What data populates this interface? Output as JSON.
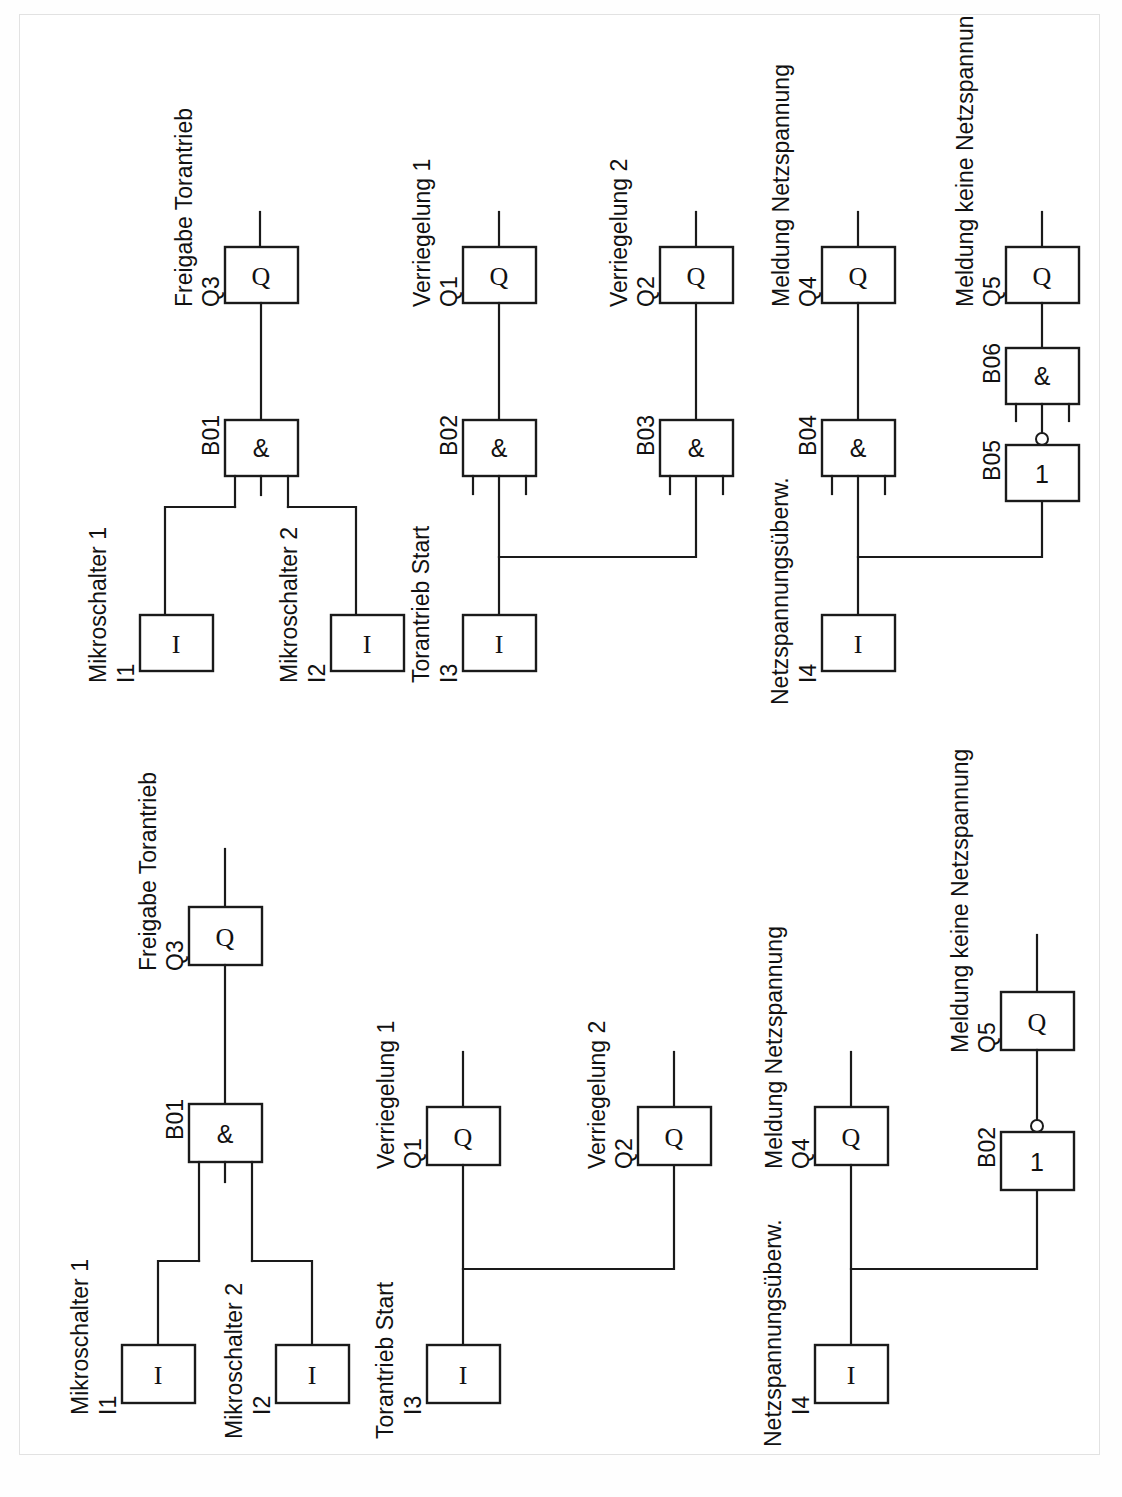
{
  "document": {
    "kind": "logic-function-block-diagram",
    "language": "de",
    "page_border_color": "#e2e2e2",
    "line_color": "#1a1a1a",
    "background": "#ffffff",
    "orientation_note": "diagram drawn rotated 90 degrees counter-clockwise on the sheet",
    "diagram_count": 2
  },
  "symbols": {
    "input_block": "I",
    "output_block": "Q",
    "and_gate": "&",
    "or_gate": "1",
    "inverter_bubble": "o"
  },
  "diagrams": [
    {
      "id": "diagram-upper",
      "name": "Schaltung mit Verriegelungs-Gattern",
      "blocks": [
        {
          "id": "I1",
          "type": "input",
          "symbol": "I",
          "tag": "I1",
          "label": "Mikroschalter 1"
        },
        {
          "id": "I2",
          "type": "input",
          "symbol": "I",
          "tag": "I2",
          "label": "Mikroschalter 2"
        },
        {
          "id": "I3",
          "type": "input",
          "symbol": "I",
          "tag": "I3",
          "label": "Torantrieb Start"
        },
        {
          "id": "I4",
          "type": "input",
          "symbol": "I",
          "tag": "I4",
          "label": "Netzspannungsüberw."
        },
        {
          "id": "B01",
          "type": "and",
          "symbol": "&",
          "tag": "B01",
          "label": "",
          "inputs": 3,
          "inverted_output": false
        },
        {
          "id": "B02",
          "type": "and",
          "symbol": "&",
          "tag": "B02",
          "label": "",
          "inputs": 3,
          "inverted_output": false
        },
        {
          "id": "B03",
          "type": "and",
          "symbol": "&",
          "tag": "B03",
          "label": "",
          "inputs": 3,
          "inverted_output": false
        },
        {
          "id": "B04",
          "type": "and",
          "symbol": "&",
          "tag": "B04",
          "label": "",
          "inputs": 3,
          "inverted_output": false
        },
        {
          "id": "B05",
          "type": "or",
          "symbol": "1",
          "tag": "B05",
          "label": "",
          "inputs": 1,
          "inverted_output": true
        },
        {
          "id": "B06",
          "type": "and",
          "symbol": "&",
          "tag": "B06",
          "label": "",
          "inputs": 3,
          "inverted_output": false
        },
        {
          "id": "Q3",
          "type": "output",
          "symbol": "Q",
          "tag": "Q3",
          "label": "Freigabe Torantrieb"
        },
        {
          "id": "Q1",
          "type": "output",
          "symbol": "Q",
          "tag": "Q1",
          "label": "Verriegelung 1"
        },
        {
          "id": "Q2",
          "type": "output",
          "symbol": "Q",
          "tag": "Q2",
          "label": "Verriegelung 2"
        },
        {
          "id": "Q4",
          "type": "output",
          "symbol": "Q",
          "tag": "Q4",
          "label": "Meldung Netzspannung"
        },
        {
          "id": "Q5",
          "type": "output",
          "symbol": "Q",
          "tag": "Q5",
          "label": "Meldung keine Netzspannung"
        }
      ],
      "connections": [
        {
          "from": "I1",
          "to": "B01"
        },
        {
          "from": "I2",
          "to": "B01"
        },
        {
          "from": "B01",
          "to": "Q3"
        },
        {
          "from": "I3",
          "to": "B02"
        },
        {
          "from": "I3",
          "to": "B03"
        },
        {
          "from": "B02",
          "to": "Q1"
        },
        {
          "from": "B03",
          "to": "Q2"
        },
        {
          "from": "I4",
          "to": "B04"
        },
        {
          "from": "I4",
          "to": "B05"
        },
        {
          "from": "B04",
          "to": "Q4"
        },
        {
          "from": "B05",
          "to": "B06"
        },
        {
          "from": "B06",
          "to": "Q5"
        }
      ]
    },
    {
      "id": "diagram-lower",
      "name": "Vereinfachte Schaltung",
      "blocks": [
        {
          "id": "I1",
          "type": "input",
          "symbol": "I",
          "tag": "I1",
          "label": "Mikroschalter 1"
        },
        {
          "id": "I2",
          "type": "input",
          "symbol": "I",
          "tag": "I2",
          "label": "Mikroschalter 2"
        },
        {
          "id": "I3",
          "type": "input",
          "symbol": "I",
          "tag": "I3",
          "label": "Torantrieb Start"
        },
        {
          "id": "I4",
          "type": "input",
          "symbol": "I",
          "tag": "I4",
          "label": "Netzspannungsüberw."
        },
        {
          "id": "B01",
          "type": "and",
          "symbol": "&",
          "tag": "B01",
          "label": "",
          "inputs": 3,
          "inverted_output": false
        },
        {
          "id": "B02",
          "type": "or",
          "symbol": "1",
          "tag": "B02",
          "label": "",
          "inputs": 1,
          "inverted_output": true
        },
        {
          "id": "Q3",
          "type": "output",
          "symbol": "Q",
          "tag": "Q3",
          "label": "Freigabe Torantrieb"
        },
        {
          "id": "Q1",
          "type": "output",
          "symbol": "Q",
          "tag": "Q1",
          "label": "Verriegelung 1"
        },
        {
          "id": "Q2",
          "type": "output",
          "symbol": "Q",
          "tag": "Q2",
          "label": "Verriegelung 2"
        },
        {
          "id": "Q4",
          "type": "output",
          "symbol": "Q",
          "tag": "Q4",
          "label": "Meldung Netzspannung"
        },
        {
          "id": "Q5",
          "type": "output",
          "symbol": "Q",
          "tag": "Q5",
          "label": "Meldung keine Netzspannung"
        }
      ],
      "connections": [
        {
          "from": "I1",
          "to": "B01"
        },
        {
          "from": "I2",
          "to": "B01"
        },
        {
          "from": "B01",
          "to": "Q3"
        },
        {
          "from": "I3",
          "to": "Q1"
        },
        {
          "from": "I3",
          "to": "Q2"
        },
        {
          "from": "I4",
          "to": "Q4"
        },
        {
          "from": "I4",
          "to": "B02"
        },
        {
          "from": "B02",
          "to": "Q5"
        }
      ]
    }
  ],
  "text": {
    "up": {
      "Q3_name": "Freigabe Torantrieb",
      "Q3_tag": "Q3",
      "Q1_name": "Verriegelung 1",
      "Q1_tag": "Q1",
      "Q2_name": "Verriegelung 2",
      "Q2_tag": "Q2",
      "Q4_name": "Meldung Netzspannung",
      "Q4_tag": "Q4",
      "Q5_name": "Meldung keine Netzspannung",
      "Q5_tag": "Q5",
      "I1_name": "Mikroschalter 1",
      "I1_tag": "I1",
      "I2_name": "Mikroschalter 2",
      "I2_tag": "I2",
      "I3_name": "Torantrieb Start",
      "I3_tag": "I3",
      "I4_name": "Netzspannungsüberw.",
      "I4_tag": "I4",
      "B01": "B01",
      "B02": "B02",
      "B03": "B03",
      "B04": "B04",
      "B05": "B05",
      "B06": "B06",
      "sym_and": "&",
      "sym_or": "1",
      "sym_in": "I",
      "sym_out": "Q"
    },
    "lo": {
      "Q3_name": "Freigabe Torantrieb",
      "Q3_tag": "Q3",
      "Q1_name": "Verriegelung 1",
      "Q1_tag": "Q1",
      "Q2_name": "Verriegelung 2",
      "Q2_tag": "Q2",
      "Q4_name": "Meldung Netzspannung",
      "Q4_tag": "Q4",
      "Q5_name": "Meldung keine Netzspannung",
      "Q5_tag": "Q5",
      "I1_name": "Mikroschalter 1",
      "I1_tag": "I1",
      "I2_name": "Mikroschalter 2",
      "I2_tag": "I2",
      "I3_name": "Torantrieb Start",
      "I3_tag": "I3",
      "I4_name": "Netzspannungsüberw.",
      "I4_tag": "I4",
      "B01": "B01",
      "B02": "B02",
      "sym_and": "&",
      "sym_or": "1",
      "sym_in": "I",
      "sym_out": "Q"
    }
  }
}
